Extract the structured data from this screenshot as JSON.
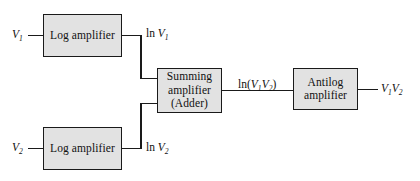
{
  "diagram": {
    "background_color": "#ffffff",
    "block_fill_color": "#e2e2e2",
    "block_border_color": "#1a1a1a",
    "wire_color": "#1a1a1a",
    "blocks": [
      {
        "id": "log-amplifier-top",
        "lines": [
          "Log amplifier"
        ],
        "x": 43,
        "y": 14,
        "w": 79,
        "h": 43
      },
      {
        "id": "log-amplifier-bottom",
        "lines": [
          "Log amplifier"
        ],
        "x": 43,
        "y": 127,
        "w": 79,
        "h": 43
      },
      {
        "id": "summing-amplifier",
        "lines": [
          "Summing",
          "amplifier",
          "(Adder)"
        ],
        "x": 157,
        "y": 68,
        "w": 65,
        "h": 45
      },
      {
        "id": "antilog-amplifier",
        "lines": [
          "Antilog",
          "amplifier"
        ],
        "x": 293,
        "y": 68,
        "w": 65,
        "h": 42
      }
    ],
    "labels": [
      {
        "id": "input-v1",
        "base": "V",
        "sub": "1",
        "prefix": "",
        "suffix": "",
        "x": 12,
        "y": 29
      },
      {
        "id": "input-v2",
        "base": "V",
        "sub": "2",
        "prefix": "",
        "suffix": "",
        "x": 12,
        "y": 142
      },
      {
        "id": "ln-v1",
        "base": "V",
        "sub": "1",
        "prefix": "ln ",
        "suffix": "",
        "x": 146,
        "y": 28
      },
      {
        "id": "ln-v2",
        "base": "V",
        "sub": "2",
        "prefix": "ln ",
        "suffix": "",
        "x": 146,
        "y": 142
      },
      {
        "id": "ln-v1v2",
        "base": "",
        "sub": "",
        "prefix": "ln(",
        "suffix": ")",
        "x": 238,
        "y": 78
      },
      {
        "id": "output-v1v2",
        "base": "",
        "sub": "",
        "prefix": "",
        "suffix": "",
        "x": 381,
        "y": 83
      }
    ],
    "label_text": {
      "input_v1": "V1",
      "input_v2": "V2",
      "ln_v1": "ln V1",
      "ln_v2": "ln V2",
      "ln_v1v2": "ln(V1V2)",
      "output_v1v2": "V1V2"
    },
    "glyphs": {
      "ln": "ln",
      "V": "V",
      "one": "1",
      "two": "2",
      "open_paren": "(",
      "close_paren": ")"
    },
    "blocks_text": {
      "log_amplifier": "Log amplifier",
      "summing": "Summing",
      "amplifier": "amplifier",
      "adder": "(Adder)",
      "antilog": "Antilog"
    }
  }
}
